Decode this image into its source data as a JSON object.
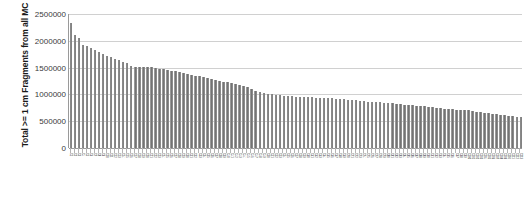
{
  "chart_data": {
    "type": "bar",
    "title": "",
    "xlabel": "",
    "ylabel": "Total >= 1 cm Fragments from all MC",
    "ylim": [
      0,
      2500000
    ],
    "ytick_labels": [
      "2500000",
      "2000000",
      "1500000",
      "1000000",
      "500000",
      "0"
    ],
    "ytick_values": [
      2500000,
      2000000,
      1500000,
      1000000,
      500000,
      0
    ],
    "grid": true,
    "legend": "none",
    "orientation": "vertical",
    "bar_color": "#7f7f7f",
    "note": "Bars sorted in descending order; category labels rendered rotated 90 degrees and illegible at source resolution",
    "categories": [
      "C1",
      "C2",
      "C3",
      "C4",
      "C5",
      "C6",
      "C7",
      "C8",
      "C9",
      "C10",
      "C11",
      "C12",
      "C13",
      "C14",
      "C15",
      "C16",
      "C17",
      "C18",
      "C19",
      "C20",
      "C21",
      "C22",
      "C23",
      "C24",
      "C25",
      "C26",
      "C27",
      "C28",
      "C29",
      "C30",
      "C31",
      "C32",
      "C33",
      "C34",
      "C35",
      "C36",
      "C37",
      "C38",
      "C39",
      "C40",
      "C41",
      "C42",
      "C43",
      "C44",
      "C45",
      "C46",
      "C47",
      "C48",
      "C49",
      "C50",
      "C51",
      "C52",
      "C53",
      "C54",
      "C55",
      "C56",
      "C57",
      "C58",
      "C59",
      "C60",
      "C61",
      "C62",
      "C63",
      "C64",
      "C65",
      "C66",
      "C67",
      "C68",
      "C69",
      "C70",
      "C71",
      "C72",
      "C73",
      "C74",
      "C75",
      "C76",
      "C77",
      "C78",
      "C79",
      "C80",
      "C81",
      "C82",
      "C83",
      "C84",
      "C85",
      "C86",
      "C87",
      "C88",
      "C89",
      "C90",
      "C91",
      "C92",
      "C93",
      "C94",
      "C95",
      "C96",
      "C97",
      "C98",
      "C99",
      "C100",
      "C101",
      "C102",
      "C103",
      "C104",
      "C105",
      "C106",
      "C107",
      "C108",
      "C109",
      "C110",
      "C111",
      "C112",
      "C113"
    ],
    "values": [
      2340000,
      2110000,
      2060000,
      1930000,
      1900000,
      1860000,
      1820000,
      1790000,
      1760000,
      1720000,
      1700000,
      1660000,
      1640000,
      1600000,
      1580000,
      1530000,
      1520000,
      1520000,
      1520000,
      1515000,
      1510000,
      1500000,
      1480000,
      1470000,
      1460000,
      1440000,
      1430000,
      1420000,
      1400000,
      1390000,
      1370000,
      1350000,
      1340000,
      1320000,
      1300000,
      1290000,
      1270000,
      1250000,
      1240000,
      1230000,
      1210000,
      1190000,
      1170000,
      1150000,
      1130000,
      1100000,
      1070000,
      1050000,
      1030000,
      1010000,
      1000000,
      990000,
      980000,
      975000,
      970000,
      965000,
      960000,
      955000,
      950000,
      948000,
      945000,
      942000,
      940000,
      935000,
      930000,
      925000,
      920000,
      915000,
      910000,
      905000,
      900000,
      890000,
      880000,
      870000,
      865000,
      860000,
      855000,
      850000,
      845000,
      840000,
      835000,
      830000,
      820000,
      810000,
      800000,
      795000,
      790000,
      785000,
      780000,
      770000,
      760000,
      750000,
      740000,
      730000,
      725000,
      720000,
      715000,
      710000,
      705000,
      700000,
      690000,
      680000,
      670000,
      660000,
      650000,
      640000,
      630000,
      620000,
      610000,
      600000,
      590000,
      580000,
      570000
    ]
  }
}
